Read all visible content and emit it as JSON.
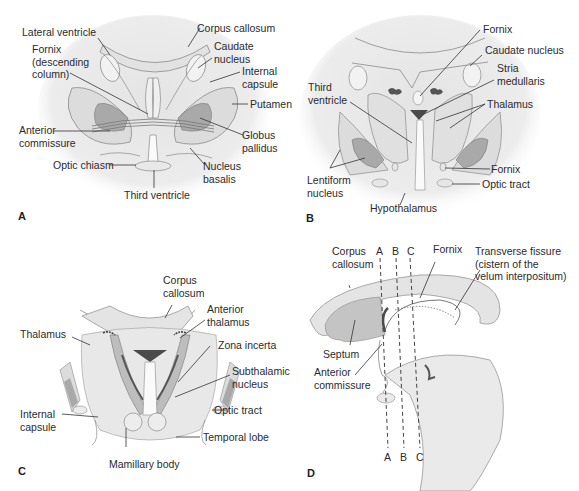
{
  "figure": {
    "panels": [
      {
        "id": "A",
        "letter": "A",
        "labels": {
          "lateral_ventricle": "Lateral ventricle",
          "fornix": "Fornix\n(descending\ncolumn)",
          "anterior_commissure": "Anterior\ncommissure",
          "optic_chiasm": "Optic chiasm",
          "third_ventricle": "Third ventricle",
          "corpus_callosum": "Corpus callosum",
          "caudate_nucleus": "Caudate\nnucleus",
          "internal_capsule": "Internal\ncapsule",
          "putamen": "Putamen",
          "globus_pallidus": "Globus\npallidus",
          "nucleus_basalis": "Nucleus\nbasalis"
        }
      },
      {
        "id": "B",
        "letter": "B",
        "labels": {
          "fornix_top": "Fornix",
          "caudate_nucleus": "Caudate nucleus",
          "stria_medullaris": "Stria\nmedullaris",
          "third_ventricle": "Third\nventricle",
          "thalamus": "Thalamus",
          "fornix_bottom": "Fornix",
          "lentiform_nucleus": "Lentiform\nnucleus",
          "optic_tract": "Optic tract",
          "hypothalamus": "Hypothalamus"
        }
      },
      {
        "id": "C",
        "letter": "C",
        "labels": {
          "corpus_callosum": "Corpus\ncallosum",
          "anterior_thalamus": "Anterior\nthalamus",
          "thalamus": "Thalamus",
          "zona_incerta": "Zona incerta",
          "subthalamic_nucleus": "Subthalamic\nnucleus",
          "internal_capsule": "Internal\ncapsule",
          "optic_tract": "Optic tract",
          "temporal_lobe": "Temporal lobe",
          "mamillary_body": "Mamillary body"
        }
      },
      {
        "id": "D",
        "letter": "D",
        "labels": {
          "corpus_callosum": "Corpus\ncallosum",
          "fornix": "Fornix",
          "transverse_fissure": "Transverse fissure\n(cistern of the\nvelum interpositum)",
          "septum": "Septum",
          "anterior_commissure": "Anterior\ncommissure"
        },
        "section_lines": {
          "top": [
            "A",
            "B",
            "C"
          ],
          "bottom": [
            "A",
            "B",
            "C"
          ]
        }
      }
    ],
    "colors": {
      "tissue_light": "#e8e8e8",
      "tissue_mid": "#d8d8d8",
      "structure_dark": "#a9a9a9",
      "nucleus_dark": "#5a5a5a",
      "outline": "#8a8a8a",
      "leader": "#333333"
    }
  }
}
